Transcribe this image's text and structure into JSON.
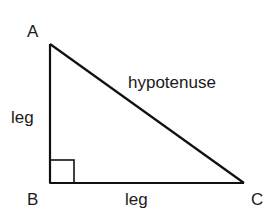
{
  "diagram": {
    "vertices": {
      "A": {
        "label": "A",
        "x": 50,
        "y": 44
      },
      "B": {
        "label": "B",
        "x": 50,
        "y": 183
      },
      "C": {
        "label": "C",
        "x": 244,
        "y": 183
      }
    },
    "labels": {
      "vertex_a": "A",
      "vertex_b": "B",
      "vertex_c": "C",
      "leg_vertical": "leg",
      "leg_horizontal": "leg",
      "hypotenuse": "hypotenuse"
    },
    "right_angle_at": "B",
    "colors": {
      "stroke": "#111111",
      "text": "#1a1a1a",
      "background": "#ffffff"
    }
  }
}
